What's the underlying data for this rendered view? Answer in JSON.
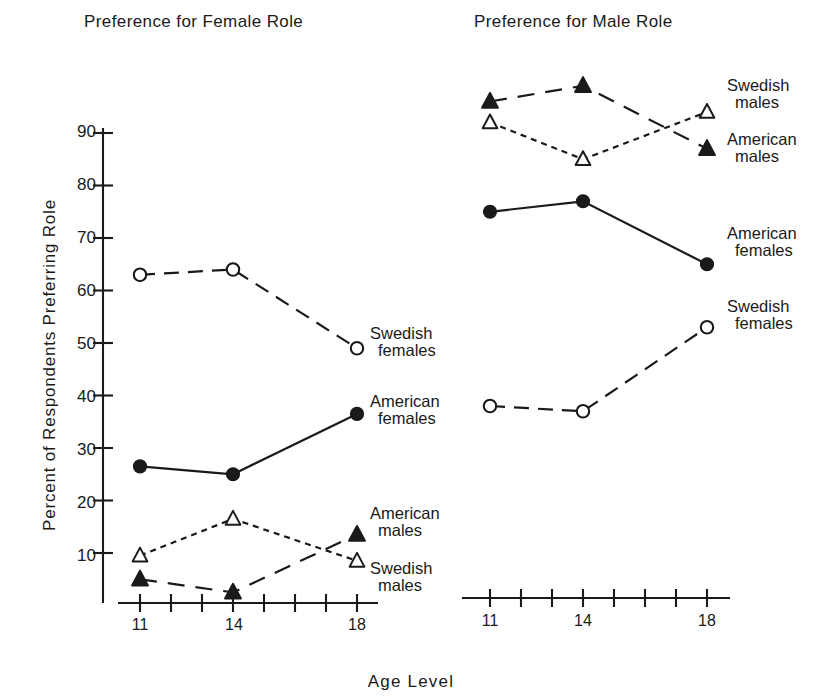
{
  "figure": {
    "axis_y_title": "Percent of Respondents Preferring Role",
    "axis_x_title": "Age  Level",
    "panels": [
      {
        "title": "Preference for Female Role"
      },
      {
        "title": "Preference for Male Role"
      }
    ],
    "y_ticks": [
      "90",
      "80",
      "70",
      "60",
      "50",
      "40",
      "30",
      "20",
      "10"
    ],
    "x_ticks_left": [
      "11",
      "14",
      "18"
    ],
    "x_ticks_right": [
      "11",
      "14",
      "18"
    ],
    "labels_left": [
      {
        "line1": "Swedish",
        "line2": "females"
      },
      {
        "line1": "American",
        "line2": "females"
      },
      {
        "line1": "American",
        "line2": "males"
      },
      {
        "line1": "Swedish",
        "line2": "males"
      }
    ],
    "labels_right": [
      {
        "line1": "Swedish",
        "line2": "males"
      },
      {
        "line1": "American",
        "line2": "males"
      },
      {
        "line1": "American",
        "line2": "females"
      },
      {
        "line1": "Swedish",
        "line2": "females"
      }
    ],
    "ink_color": "#1a1a1a"
  },
  "chart_data": [
    {
      "type": "line",
      "title": "Preference for Female Role",
      "xlabel": "Age Level",
      "ylabel": "Percent of Respondents Preferring Role",
      "x": [
        11,
        14,
        18
      ],
      "xlim": [
        10.2,
        18.6
      ],
      "ylim": [
        0,
        93
      ],
      "yticks": [
        10,
        20,
        30,
        40,
        50,
        60,
        70,
        80,
        90
      ],
      "grid": false,
      "legend": "right-of-line-end",
      "series": [
        {
          "name": "Swedish females",
          "marker": "open-circle",
          "line": "dashed",
          "values": [
            63.0,
            64.0,
            49.0
          ]
        },
        {
          "name": "American females",
          "marker": "filled-circle",
          "line": "solid",
          "values": [
            26.5,
            25.0,
            36.5
          ]
        },
        {
          "name": "American males",
          "marker": "filled-triangle",
          "line": "long-dashed",
          "values": [
            5.0,
            2.5,
            13.5
          ]
        },
        {
          "name": "Swedish males",
          "marker": "open-triangle",
          "line": "dotted",
          "values": [
            9.5,
            16.5,
            8.5
          ]
        }
      ]
    },
    {
      "type": "line",
      "title": "Preference for Male Role",
      "xlabel": "Age Level",
      "ylabel": "Percent of Respondents Preferring Role",
      "x": [
        11,
        14,
        18
      ],
      "xlim": [
        10.2,
        18.6
      ],
      "ylim": [
        0,
        101
      ],
      "grid": false,
      "legend": "right-of-line-end",
      "series": [
        {
          "name": "American males",
          "marker": "filled-triangle",
          "line": "long-dashed",
          "values": [
            96.0,
            99.0,
            87.0
          ]
        },
        {
          "name": "Swedish males",
          "marker": "open-triangle",
          "line": "dotted",
          "values": [
            92.0,
            85.0,
            94.0
          ]
        },
        {
          "name": "American females",
          "marker": "filled-circle",
          "line": "solid",
          "values": [
            75.0,
            77.0,
            65.0
          ]
        },
        {
          "name": "Swedish females",
          "marker": "open-circle",
          "line": "dashed",
          "values": [
            38.0,
            37.0,
            53.0
          ]
        }
      ]
    }
  ]
}
